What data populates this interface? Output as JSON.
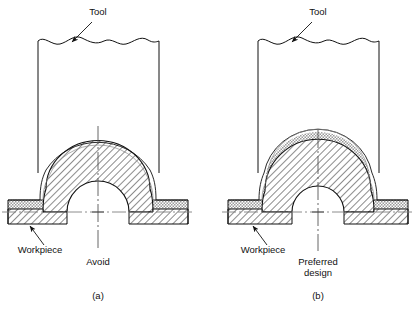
{
  "figure": {
    "type": "engineering-cross-section",
    "background_color": "#ffffff",
    "line_color": "#111111",
    "centerline_color": "#777777",
    "stipple_fill_color": "#dcdcdc",
    "hatch_fill_color": "#ffffff"
  },
  "panels": [
    {
      "id": "a",
      "caption": "(a)",
      "caption_x": 98,
      "caption_y": 299,
      "tool_label": "Tool",
      "tool_label_x": 98,
      "tool_label_y": 15,
      "workpiece_label": "Workpiece",
      "workpiece_label_x": 40,
      "workpiece_label_y": 253,
      "verdict_label": "Avoid",
      "verdict_label_x": 98,
      "verdict_label_y": 265,
      "verdict_lines": [
        "Avoid"
      ],
      "centerline_x": 98,
      "baseline_y": 212,
      "tool": {
        "left_x": 38,
        "right_x": 159,
        "bottom_y": 173,
        "break_y": 41
      },
      "dome": {
        "outer_rx": 61,
        "outer_ry": 58,
        "stipple_rx": 53,
        "stipple_ry": 50,
        "hatch_rx": 45,
        "hatch_ry": 42,
        "inner_rx": 31,
        "inner_ry": 31
      },
      "flange": {
        "left_x": 8,
        "right_x": 188,
        "top_y": 200,
        "mid_y": 209,
        "bottom_y": 224,
        "shoulder_left_x": 43,
        "shoulder_right_x": 153
      }
    },
    {
      "id": "b",
      "caption": "(b)",
      "caption_x": 318,
      "caption_y": 299,
      "tool_label": "Tool",
      "tool_label_x": 318,
      "tool_label_y": 15,
      "workpiece_label": "Workpiece",
      "workpiece_label_x": 263,
      "workpiece_label_y": 253,
      "verdict_label": "Preferred design",
      "verdict_label_x": 318,
      "verdict_label_y": 265,
      "verdict_lines": [
        "Preferred",
        "design"
      ],
      "centerline_x": 318,
      "baseline_y": 212,
      "tool": {
        "left_x": 258,
        "right_x": 379,
        "bottom_y": 173,
        "break_y": 41
      },
      "dome": {
        "outer_rx": 55,
        "outer_ry": 54,
        "stipple_rx": 48,
        "stipple_ry": 47,
        "hatch_rx": 41,
        "hatch_ry": 40,
        "inner_rx": 26,
        "inner_ry": 26
      },
      "flange": {
        "left_x": 228,
        "right_x": 408,
        "top_y": 200,
        "mid_y": 209,
        "bottom_y": 224,
        "shoulder_left_x": 262,
        "shoulder_right_x": 374
      }
    }
  ],
  "legend_notes": {
    "stipple_meaning": "blank / original sheet thickness envelope",
    "hatch_meaning": "formed workpiece section"
  }
}
